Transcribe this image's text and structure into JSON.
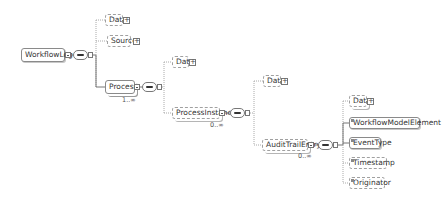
{
  "diagram": {
    "type": "xml-schema-tree",
    "root": {
      "label": "WorkflowLog",
      "compositor": "sequence"
    },
    "workflowlog_children": [
      {
        "label": "Data",
        "optional": true,
        "expandable": true
      },
      {
        "label": "Source",
        "optional": true,
        "expandable": true
      },
      {
        "label": "Process",
        "optional": false,
        "cardinality": "1..∞",
        "compositor": "sequence"
      }
    ],
    "process_children": [
      {
        "label": "Data",
        "optional": true,
        "expandable": true
      },
      {
        "label": "ProcessInstance",
        "optional": true,
        "cardinality": "0..∞",
        "compositor": "sequence"
      }
    ],
    "processinstance_children": [
      {
        "label": "Data",
        "optional": true,
        "expandable": true
      },
      {
        "label": "AuditTrailEntry",
        "optional": true,
        "cardinality": "0..∞",
        "compositor": "sequence"
      }
    ],
    "audittrailentry_children": [
      {
        "label": "Data",
        "optional": true,
        "expandable": true
      },
      {
        "label": "WorkflowModelElement",
        "optional": false
      },
      {
        "label": "EventType",
        "optional": false
      },
      {
        "label": "Timestamp",
        "optional": true
      },
      {
        "label": "Originator",
        "optional": true
      }
    ],
    "colors": {
      "line": "#8a8a8a",
      "dashed_line": "#aaaaaa",
      "border": "#8a8a8a"
    }
  }
}
